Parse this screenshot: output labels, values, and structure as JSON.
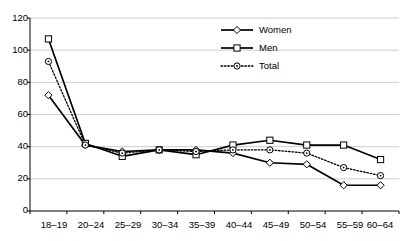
{
  "chart_data": {
    "type": "line",
    "title": "",
    "subtitle": "",
    "xlabel": "",
    "ylabel": "",
    "categories": [
      "18–19",
      "20–24",
      "25–29",
      "30–34",
      "35–39",
      "40–44",
      "45–49",
      "50–54",
      "55–59",
      "60–64"
    ],
    "series": [
      {
        "name": "Women",
        "marker": "diamond",
        "linestyle": "solid",
        "color": "#000000",
        "values": [
          72,
          41,
          37,
          38,
          38,
          36,
          30,
          29,
          16,
          16
        ]
      },
      {
        "name": "Men",
        "marker": "square",
        "linestyle": "solid",
        "color": "#000000",
        "values": [
          107,
          42,
          34,
          38,
          35,
          41,
          44,
          41,
          41,
          32
        ]
      },
      {
        "name": "Total",
        "marker": "circle",
        "linestyle": "dotted",
        "color": "#000000",
        "values": [
          93,
          41,
          36,
          38,
          37,
          38,
          38,
          36,
          27,
          22
        ]
      }
    ],
    "ylim": [
      0,
      120
    ],
    "yticks": [
      0,
      20,
      40,
      60,
      80,
      100,
      120
    ],
    "ytick_labels": [
      "0",
      "20",
      "40",
      "60",
      "80",
      "100",
      "120"
    ],
    "grid": "horizontal",
    "grid_color": "#bfbfbf",
    "axis_color": "#000000",
    "legend_position": "top-center",
    "legend_border": false,
    "background": "#ffffff"
  }
}
